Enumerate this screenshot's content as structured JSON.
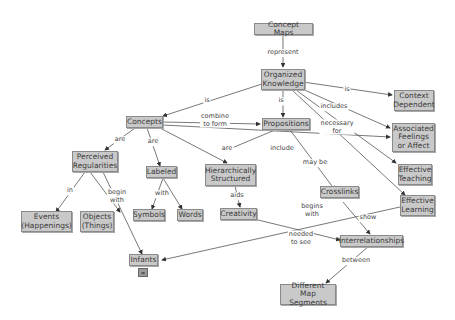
{
  "nodes": {
    "concept_maps": "Concept Maps",
    "organized_knowledge": "Organized\nKnowledge",
    "context_dependent": "Context\nDependent",
    "concepts": "Concepts",
    "propositions": "Propositions",
    "associated_feelings": "Associated\nFeelings\nor Affect",
    "perceived_regularities": "Perceived\nRegularities",
    "labeled": "Labeled",
    "hierarchically_structured": "Hierarchically\nStructured",
    "effective_teaching": "Effective\nTeaching",
    "effective_learning": "Effective\nLearning",
    "crosslinks": "Crosslinks",
    "events": "Events\n(Happenings)",
    "objects": "Objects\n(Things)",
    "symbols": "Symbols",
    "words": "Words",
    "creativity": "Creativity",
    "interrelationships": "Interrelationships",
    "infants": "Infants",
    "different_map_segments": "Different\nMap Segments"
  },
  "links": {
    "represent": "represent",
    "is_concepts": "is",
    "is_propositions": "is",
    "is_context": "is",
    "includes": "includes",
    "necessary_for": "necessary\nfor",
    "combine_to_form": "combine\nto form",
    "are_perceived": "are",
    "are_labeled": "are",
    "are_hier": "are",
    "include": "include",
    "may_be": "may be",
    "in": "in",
    "begin_with": "begin\nwith",
    "with": "with",
    "aids": "aids",
    "begins_with": "begins\nwith",
    "show": "show",
    "needed_to_see": "needed\nto see",
    "between": "between"
  },
  "icons": {
    "infants_resource": "link-icon"
  }
}
